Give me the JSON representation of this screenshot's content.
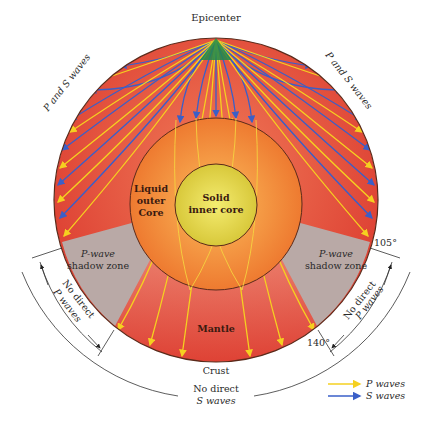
{
  "diagram": {
    "labels": {
      "epicenter": "Epicenter",
      "p_and_s_left": "P and S waves",
      "p_and_s_right": "P and S waves",
      "liquid_outer_core": [
        "Liquid",
        "outer",
        "Core"
      ],
      "solid_inner_core": [
        "Solid",
        "inner core"
      ],
      "p_shadow_left": [
        "P-wave",
        "shadow zone"
      ],
      "p_shadow_right": [
        "P-wave",
        "shadow zone"
      ],
      "mantle": "Mantle",
      "crust": "Crust",
      "no_direct_p_left": [
        "No direct",
        "P waves"
      ],
      "no_direct_p_right": [
        "No direct",
        "P waves"
      ],
      "no_direct_s": [
        "No direct",
        "S waves"
      ],
      "angle_105": "105°",
      "angle_140": "140°"
    },
    "legend": [
      {
        "label": "P waves",
        "color": "#f5d020",
        "icon": "yellow-arrow-icon"
      },
      {
        "label": "S waves",
        "color": "#3a5fc8",
        "icon": "blue-arrow-icon"
      }
    ],
    "colors": {
      "mantle": "#e2463a",
      "outer_core": "#f08a3a",
      "inner_core": "#e4d640",
      "shadow_zone": "#b9a9a6",
      "epicenter": "#1f8a4c",
      "p_wave": "#f5d020",
      "s_wave": "#3a5fc8",
      "outline": "#5a2a1a"
    },
    "geometry": {
      "earth_center": [
        216,
        200
      ],
      "earth_radius": 162,
      "outer_core_radius": 86,
      "inner_core_radius": 41,
      "shadow_zone_degrees": [
        105,
        140
      ]
    }
  }
}
